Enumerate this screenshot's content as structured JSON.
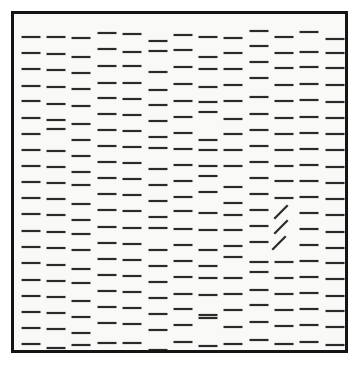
{
  "page": {
    "width": 361,
    "height": 373,
    "background_color": "#ffffff"
  },
  "frame": {
    "name": "stimulus-frame",
    "left": 11,
    "top": 11,
    "width": 337,
    "height": 342,
    "border_width": 3,
    "border_color": "#141414",
    "fill_color": "#f9f9f7"
  },
  "array": {
    "columns": 13,
    "rows": 20,
    "column_spacing": 25.0,
    "row_spacing": 16.0,
    "first_column_x": 31,
    "first_row_y": 36,
    "element_length": 19,
    "element_thickness": 2.2,
    "element_color": "#2a2a2a",
    "jitter_range_px": 5,
    "distractor_orientation_deg": 0,
    "target_orientation_deg": -45,
    "target_count": 3,
    "distractor_count": 257,
    "total_elements": 260
  },
  "targets": [
    {
      "name": "target-line-1",
      "column": 11,
      "row": 12,
      "x": 281,
      "y": 212,
      "angle_deg": -45
    },
    {
      "name": "target-line-2",
      "column": 11,
      "row": 13,
      "x": 281,
      "y": 227,
      "angle_deg": -45
    },
    {
      "name": "target-line-3",
      "column": 11,
      "row": 14,
      "x": 279,
      "y": 243,
      "angle_deg": -45
    }
  ],
  "chart_data": {
    "type": "scatter",
    "xlabel": "",
    "ylabel": "",
    "xlim": [
      11,
      348
    ],
    "ylim": [
      11,
      353
    ],
    "grid": false,
    "legend": null,
    "series": [
      {
        "name": "distractors",
        "orientation_deg": 0,
        "marker": "horizontal-line-segment",
        "color": "#2a2a2a",
        "points": [
          [
            31,
            37
          ],
          [
            56,
            37
          ],
          [
            81,
            38
          ],
          [
            107,
            33
          ],
          [
            132,
            34
          ],
          [
            158,
            41
          ],
          [
            183,
            35
          ],
          [
            208,
            37
          ],
          [
            233,
            38
          ],
          [
            259,
            31
          ],
          [
            284,
            37
          ],
          [
            309,
            32
          ],
          [
            335,
            39
          ],
          [
            31,
            53
          ],
          [
            56,
            54
          ],
          [
            81,
            57
          ],
          [
            107,
            49
          ],
          [
            132,
            52
          ],
          [
            158,
            51
          ],
          [
            183,
            50
          ],
          [
            208,
            57
          ],
          [
            233,
            53
          ],
          [
            259,
            46
          ],
          [
            284,
            53
          ],
          [
            309,
            52
          ],
          [
            335,
            53
          ],
          [
            31,
            69
          ],
          [
            56,
            70
          ],
          [
            81,
            73
          ],
          [
            107,
            66
          ],
          [
            132,
            66
          ],
          [
            158,
            72
          ],
          [
            183,
            67
          ],
          [
            208,
            69
          ],
          [
            233,
            69
          ],
          [
            259,
            62
          ],
          [
            284,
            68
          ],
          [
            309,
            67
          ],
          [
            335,
            68
          ],
          [
            31,
            86
          ],
          [
            56,
            87
          ],
          [
            81,
            89
          ],
          [
            107,
            83
          ],
          [
            132,
            83
          ],
          [
            158,
            90
          ],
          [
            183,
            84
          ],
          [
            208,
            87
          ],
          [
            233,
            85
          ],
          [
            259,
            78
          ],
          [
            284,
            85
          ],
          [
            309,
            84
          ],
          [
            335,
            85
          ],
          [
            31,
            101
          ],
          [
            56,
            104
          ],
          [
            81,
            106
          ],
          [
            107,
            98
          ],
          [
            132,
            99
          ],
          [
            158,
            105
          ],
          [
            183,
            101
          ],
          [
            208,
            102
          ],
          [
            233,
            101
          ],
          [
            259,
            97
          ],
          [
            284,
            101
          ],
          [
            309,
            100
          ],
          [
            335,
            102
          ],
          [
            31,
            118
          ],
          [
            56,
            120
          ],
          [
            81,
            124
          ],
          [
            107,
            114
          ],
          [
            132,
            115
          ],
          [
            158,
            121
          ],
          [
            183,
            117
          ],
          [
            208,
            112
          ],
          [
            233,
            119
          ],
          [
            259,
            114
          ],
          [
            284,
            118
          ],
          [
            309,
            117
          ],
          [
            335,
            118
          ],
          [
            31,
            134
          ],
          [
            56,
            129
          ],
          [
            81,
            140
          ],
          [
            107,
            130
          ],
          [
            132,
            131
          ],
          [
            158,
            137
          ],
          [
            183,
            133
          ],
          [
            208,
            140
          ],
          [
            233,
            134
          ],
          [
            259,
            130
          ],
          [
            284,
            134
          ],
          [
            309,
            133
          ],
          [
            335,
            134
          ],
          [
            31,
            150
          ],
          [
            56,
            151
          ],
          [
            81,
            156
          ],
          [
            107,
            146
          ],
          [
            132,
            147
          ],
          [
            158,
            148
          ],
          [
            183,
            149
          ],
          [
            208,
            150
          ],
          [
            233,
            150
          ],
          [
            259,
            146
          ],
          [
            284,
            150
          ],
          [
            309,
            149
          ],
          [
            335,
            150
          ],
          [
            31,
            166
          ],
          [
            56,
            167
          ],
          [
            81,
            172
          ],
          [
            107,
            162
          ],
          [
            132,
            163
          ],
          [
            158,
            169
          ],
          [
            183,
            165
          ],
          [
            208,
            166
          ],
          [
            233,
            166
          ],
          [
            259,
            162
          ],
          [
            284,
            166
          ],
          [
            309,
            165
          ],
          [
            335,
            167
          ],
          [
            31,
            182
          ],
          [
            56,
            183
          ],
          [
            81,
            185
          ],
          [
            107,
            178
          ],
          [
            132,
            179
          ],
          [
            158,
            185
          ],
          [
            183,
            181
          ],
          [
            208,
            176
          ],
          [
            233,
            187
          ],
          [
            259,
            178
          ],
          [
            284,
            181
          ],
          [
            309,
            181
          ],
          [
            335,
            183
          ],
          [
            31,
            198
          ],
          [
            56,
            199
          ],
          [
            81,
            204
          ],
          [
            107,
            194
          ],
          [
            132,
            195
          ],
          [
            158,
            201
          ],
          [
            183,
            197
          ],
          [
            208,
            192
          ],
          [
            233,
            203
          ],
          [
            259,
            194
          ],
          [
            284,
            198
          ],
          [
            309,
            197
          ],
          [
            335,
            199
          ],
          [
            31,
            214
          ],
          [
            56,
            215
          ],
          [
            81,
            220
          ],
          [
            107,
            210
          ],
          [
            132,
            211
          ],
          [
            158,
            217
          ],
          [
            183,
            211
          ],
          [
            208,
            213
          ],
          [
            233,
            215
          ],
          [
            259,
            210
          ],
          [
            309,
            213
          ],
          [
            335,
            215
          ],
          [
            31,
            231
          ],
          [
            56,
            232
          ],
          [
            81,
            234
          ],
          [
            107,
            227
          ],
          [
            132,
            228
          ],
          [
            158,
            228
          ],
          [
            183,
            229
          ],
          [
            208,
            230
          ],
          [
            233,
            230
          ],
          [
            259,
            226
          ],
          [
            309,
            229
          ],
          [
            335,
            232
          ],
          [
            31,
            247
          ],
          [
            56,
            248
          ],
          [
            81,
            250
          ],
          [
            107,
            243
          ],
          [
            132,
            244
          ],
          [
            158,
            250
          ],
          [
            183,
            245
          ],
          [
            208,
            250
          ],
          [
            233,
            246
          ],
          [
            259,
            242
          ],
          [
            309,
            245
          ],
          [
            335,
            248
          ],
          [
            31,
            263
          ],
          [
            56,
            265
          ],
          [
            81,
            269
          ],
          [
            107,
            259
          ],
          [
            132,
            260
          ],
          [
            158,
            266
          ],
          [
            183,
            261
          ],
          [
            208,
            266
          ],
          [
            233,
            257
          ],
          [
            259,
            262
          ],
          [
            284,
            262
          ],
          [
            309,
            261
          ],
          [
            335,
            263
          ],
          [
            31,
            280
          ],
          [
            56,
            281
          ],
          [
            81,
            283
          ],
          [
            107,
            275
          ],
          [
            132,
            276
          ],
          [
            158,
            282
          ],
          [
            183,
            277
          ],
          [
            208,
            278
          ],
          [
            233,
            278
          ],
          [
            259,
            272
          ],
          [
            284,
            278
          ],
          [
            309,
            277
          ],
          [
            335,
            279
          ],
          [
            31,
            296
          ],
          [
            56,
            297
          ],
          [
            81,
            301
          ],
          [
            107,
            291
          ],
          [
            132,
            292
          ],
          [
            158,
            298
          ],
          [
            183,
            294
          ],
          [
            208,
            295
          ],
          [
            233,
            294
          ],
          [
            259,
            290
          ],
          [
            284,
            294
          ],
          [
            309,
            293
          ],
          [
            335,
            296
          ],
          [
            31,
            312
          ],
          [
            56,
            313
          ],
          [
            81,
            317
          ],
          [
            107,
            307
          ],
          [
            132,
            308
          ],
          [
            158,
            314
          ],
          [
            183,
            309
          ],
          [
            208,
            315
          ],
          [
            233,
            310
          ],
          [
            259,
            305
          ],
          [
            284,
            310
          ],
          [
            309,
            309
          ],
          [
            335,
            311
          ],
          [
            31,
            328
          ],
          [
            56,
            329
          ],
          [
            81,
            333
          ],
          [
            107,
            323
          ],
          [
            132,
            324
          ],
          [
            158,
            330
          ],
          [
            183,
            325
          ],
          [
            208,
            318
          ],
          [
            233,
            327
          ],
          [
            259,
            322
          ],
          [
            284,
            326
          ],
          [
            309,
            325
          ],
          [
            335,
            327
          ],
          [
            31,
            344
          ],
          [
            56,
            348
          ],
          [
            81,
            345
          ],
          [
            107,
            343
          ],
          [
            132,
            343
          ],
          [
            158,
            350
          ],
          [
            183,
            342
          ],
          [
            208,
            346
          ],
          [
            233,
            344
          ],
          [
            259,
            340
          ],
          [
            284,
            344
          ],
          [
            309,
            342
          ],
          [
            335,
            345
          ]
        ]
      },
      {
        "name": "targets",
        "orientation_deg": -45,
        "marker": "oblique-line-segment",
        "color": "#2a2a2a",
        "points": [
          [
            281,
            212
          ],
          [
            281,
            227
          ],
          [
            279,
            243
          ]
        ]
      }
    ]
  }
}
